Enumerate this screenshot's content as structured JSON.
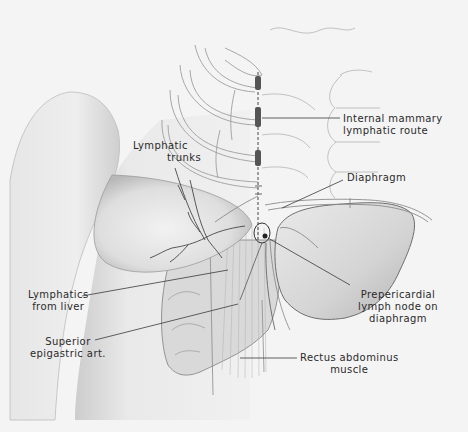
{
  "figure": {
    "type": "anatomical illustration",
    "colors": {
      "background": "#f4f4f4",
      "ink": "#2a2a2a",
      "skin_shade": "#cfcfcf",
      "liver_shade": "#d6d6d6"
    },
    "labels": {
      "internal_mammary": {
        "line1": "Internal mammary",
        "line2": "lymphatic route"
      },
      "lymphatic_trunks": {
        "line1": "Lymphatic",
        "line2": "trunks"
      },
      "diaphragm": {
        "line1": "Diaphragm"
      },
      "lymphatics_from_liver": {
        "line1": "Lymphatics",
        "line2": "from liver"
      },
      "prepericardial": {
        "line1": "Prepericardial",
        "line2": "lymph node on",
        "line3": "diaphragm"
      },
      "superior_epigastric": {
        "line1": "Superior",
        "line2": "epigastric art."
      },
      "rectus_abdominus": {
        "line1": "Rectus abdominus",
        "line2": "muscle"
      }
    }
  }
}
